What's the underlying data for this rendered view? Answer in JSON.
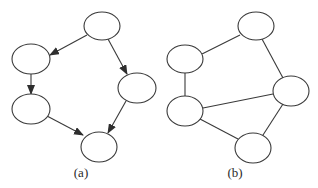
{
  "figure": {
    "width": 318,
    "height": 188,
    "stroke_color": "#3a3a3a",
    "background": "#ffffff"
  },
  "panels": [
    {
      "id": "a",
      "caption": "(a)",
      "caption_pos": {
        "x": 81,
        "y": 177
      },
      "directed": true,
      "nodes": [
        {
          "id": "a1",
          "cx": 102,
          "cy": 26,
          "rx": 18,
          "ry": 14
        },
        {
          "id": "a2",
          "cx": 31,
          "cy": 59,
          "rx": 19,
          "ry": 15
        },
        {
          "id": "a3",
          "cx": 31,
          "cy": 109,
          "rx": 19,
          "ry": 15
        },
        {
          "id": "a4",
          "cx": 137,
          "cy": 88,
          "rx": 19,
          "ry": 15
        },
        {
          "id": "a5",
          "cx": 99,
          "cy": 147,
          "rx": 18,
          "ry": 15
        }
      ],
      "edges": [
        {
          "from": "a1",
          "to": "a2",
          "x1": 87,
          "y1": 35,
          "x2": 50,
          "y2": 55
        },
        {
          "from": "a2",
          "to": "a3",
          "x1": 31,
          "y1": 74,
          "x2": 31,
          "y2": 94
        },
        {
          "from": "a1",
          "to": "a4",
          "x1": 108,
          "y1": 39,
          "x2": 127,
          "y2": 74
        },
        {
          "from": "a3",
          "to": "a5",
          "x1": 47,
          "y1": 116,
          "x2": 83,
          "y2": 135
        },
        {
          "from": "a4",
          "to": "a5",
          "x1": 126,
          "y1": 101,
          "x2": 108,
          "y2": 133
        }
      ]
    },
    {
      "id": "b",
      "caption": "(b)",
      "caption_pos": {
        "x": 235,
        "y": 177
      },
      "directed": false,
      "nodes": [
        {
          "id": "b1",
          "cx": 256,
          "cy": 26,
          "rx": 18,
          "ry": 14
        },
        {
          "id": "b2",
          "cx": 185,
          "cy": 59,
          "rx": 18,
          "ry": 14
        },
        {
          "id": "b3",
          "cx": 185,
          "cy": 111,
          "rx": 18,
          "ry": 15
        },
        {
          "id": "b4",
          "cx": 291,
          "cy": 91,
          "rx": 18,
          "ry": 15
        },
        {
          "id": "b5",
          "cx": 253,
          "cy": 148,
          "rx": 18,
          "ry": 15
        }
      ],
      "edges": [
        {
          "from": "b2",
          "to": "b1",
          "x1": 202,
          "y1": 54,
          "x2": 240,
          "y2": 35
        },
        {
          "from": "b1",
          "to": "b4",
          "x1": 262,
          "y1": 39,
          "x2": 283,
          "y2": 78
        },
        {
          "from": "b2",
          "to": "b3",
          "x1": 185,
          "y1": 73,
          "x2": 185,
          "y2": 96
        },
        {
          "from": "b3",
          "to": "b4",
          "x1": 203,
          "y1": 108,
          "x2": 273,
          "y2": 94
        },
        {
          "from": "b3",
          "to": "b5",
          "x1": 200,
          "y1": 119,
          "x2": 238,
          "y2": 139
        },
        {
          "from": "b4",
          "to": "b5",
          "x1": 283,
          "y1": 104,
          "x2": 263,
          "y2": 135
        }
      ]
    }
  ]
}
